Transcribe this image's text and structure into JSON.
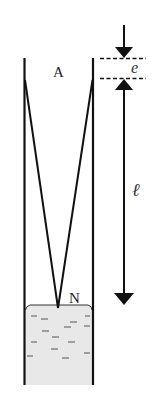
{
  "diagram": {
    "type": "physics-schematic",
    "labels": {
      "top_point": "A",
      "surface_point": "N",
      "small_gap": "e",
      "length": "ℓ"
    },
    "dimensions": {
      "gap_marker": "e",
      "length_marker": "ℓ"
    },
    "colors": {
      "stroke": "#111111",
      "liquid_fill": "#e8e8e8",
      "liquid_dash": "#555555",
      "background": "#ffffff"
    }
  }
}
